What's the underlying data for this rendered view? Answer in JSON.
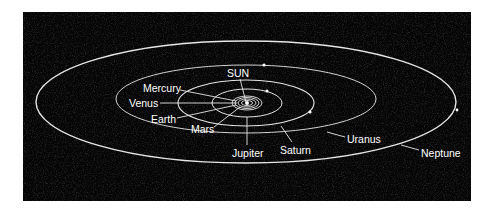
{
  "diagram": {
    "background_color": "#050505",
    "line_color": "#e8e8e8",
    "labels": {
      "sun": "SUN",
      "mercury": "Mercury",
      "venus": "Venus",
      "earth": "Earth",
      "mars": "Mars",
      "jupiter": "Jupiter",
      "saturn": "Saturn",
      "uranus": "Uranus",
      "neptune": "Neptune"
    },
    "orbits": [
      {
        "name": "Mercury",
        "order": 1
      },
      {
        "name": "Venus",
        "order": 2
      },
      {
        "name": "Earth",
        "order": 3
      },
      {
        "name": "Mars",
        "order": 4
      },
      {
        "name": "Jupiter",
        "order": 5
      },
      {
        "name": "Saturn",
        "order": 6
      },
      {
        "name": "Uranus",
        "order": 7
      },
      {
        "name": "Neptune",
        "order": 8
      }
    ]
  }
}
